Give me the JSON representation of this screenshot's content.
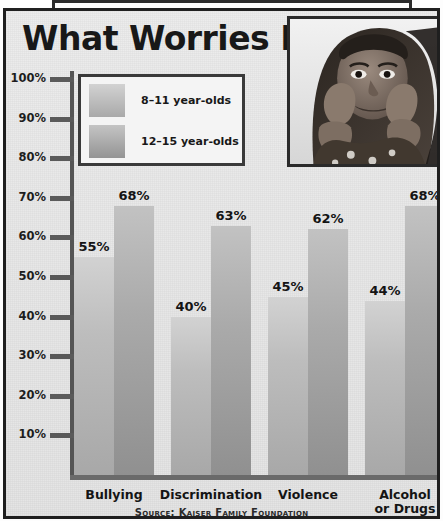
{
  "title": "What Worries Kids",
  "source": "Source: Kaiser Family Foundation",
  "photo_alt": "girl-resting-chin-on-hands-photo",
  "legend": {
    "items": [
      {
        "label": "8–11 year-olds",
        "color": "#bdbdbd"
      },
      {
        "label": "12–15 year-olds",
        "color": "#aaaaaa"
      }
    ]
  },
  "axis": {
    "ticks": [
      "100%",
      "90%",
      "80%",
      "70%",
      "60%",
      "50%",
      "40%",
      "30%",
      "20%",
      "10%"
    ],
    "tick_values": [
      100,
      90,
      80,
      70,
      60,
      50,
      40,
      30,
      20,
      10
    ]
  },
  "chart_data": {
    "type": "bar",
    "title": "What Worries Kids",
    "xlabel": "",
    "ylabel": "",
    "ylim": [
      0,
      100
    ],
    "grid": false,
    "legend_position": "top-left",
    "categories": [
      "Bullying",
      "Discrimination",
      "Violence",
      "Alcohol or Drugs"
    ],
    "series": [
      {
        "name": "8–11 year-olds",
        "values": [
          55,
          40,
          45,
          44
        ],
        "labels": [
          "55%",
          "40%",
          "45%",
          "44%"
        ]
      },
      {
        "name": "12–15 year-olds",
        "values": [
          68,
          63,
          62,
          68
        ],
        "labels": [
          "68%",
          "63%",
          "62%",
          "68%"
        ]
      }
    ],
    "annotations": [
      "Source: Kaiser Family Foundation"
    ]
  },
  "category_lines": [
    [
      "Bullying"
    ],
    [
      "Discrimination"
    ],
    [
      "Violence"
    ],
    [
      "Alcohol",
      "or Drugs"
    ]
  ]
}
